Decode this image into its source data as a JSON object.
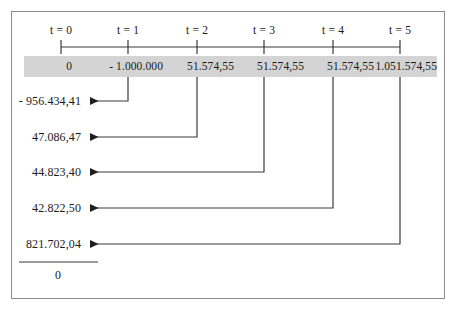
{
  "diagram": {
    "axis": {
      "tick_labels": [
        "t = 0",
        "t = 1",
        "t = 2",
        "t = 3",
        "t = 4",
        "t = 5"
      ]
    },
    "cash_flows": [
      {
        "period": "t = 0",
        "value": "0"
      },
      {
        "period": "t = 1",
        "value": "- 1.000.000"
      },
      {
        "period": "t = 2",
        "value": "51.574,55"
      },
      {
        "period": "t = 3",
        "value": "51.574,55"
      },
      {
        "period": "t = 4",
        "value": "51.574,55"
      },
      {
        "period": "t = 5",
        "value": "1.051.574,55"
      }
    ],
    "present_values": [
      {
        "from_period": "t = 1",
        "value": "- 956.434,41"
      },
      {
        "from_period": "t = 2",
        "value": "47.086,47"
      },
      {
        "from_period": "t = 3",
        "value": "44.823,40"
      },
      {
        "from_period": "t = 4",
        "value": "42.822,50"
      },
      {
        "from_period": "t = 5",
        "value": "821.702,04"
      }
    ],
    "total": "0",
    "colors": {
      "band_fill": "#d4d4d4",
      "frame_border": "#8a8a8a",
      "line": "#3a3a3a",
      "text": "#1a1a1a"
    }
  }
}
